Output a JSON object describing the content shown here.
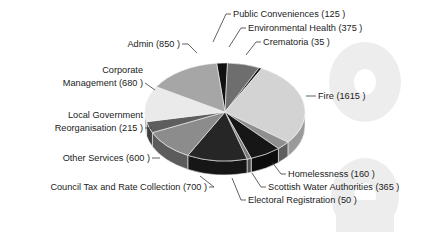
{
  "chart_data": {
    "type": "pie",
    "title": "",
    "subtitle": "",
    "xlabel": "",
    "ylabel": "",
    "legend_position": "none",
    "grid": false,
    "label_format": "{name} ({value} )",
    "total": 5895,
    "categories": [
      "Public Conveniences",
      "Environmental Health",
      "Crematoria",
      "Fire",
      "Homelessness",
      "Scottish Water Authorities",
      "Electoral Registration",
      "Council Tax and Rate Collection",
      "Other Services",
      "Local Government Reorganisation",
      "Corporate Management",
      "Admin"
    ],
    "values": [
      125,
      375,
      35,
      1615,
      160,
      365,
      50,
      700,
      600,
      215,
      680,
      850
    ],
    "slices": [
      {
        "name": "Public Conveniences",
        "value": 125,
        "label": "Public Conveniences (125 )",
        "color": "#111111",
        "side_color": "#070707"
      },
      {
        "name": "Environmental Health",
        "value": 375,
        "label": "Environmental Health (375 )",
        "color": "#6e6e6e",
        "side_color": "#4a4a4a"
      },
      {
        "name": "Crematoria",
        "value": 35,
        "label": "Crematoria (35 )",
        "color": "#1a1a1a",
        "side_color": "#101010"
      },
      {
        "name": "Fire",
        "value": 1615,
        "label": "Fire (1615 )",
        "color": "#d3d3d3",
        "side_color": "#9a9a9a"
      },
      {
        "name": "Homelessness",
        "value": 160,
        "label": "Homelessness (160 )",
        "color": "#8f8f8f",
        "side_color": "#5f5f5f"
      },
      {
        "name": "Scottish Water Authorities",
        "value": 365,
        "label": "Scottish Water Authorities (365 )",
        "color": "#161616",
        "side_color": "#0c0c0c"
      },
      {
        "name": "Electoral Registration",
        "value": 50,
        "label": "Electoral Registration (50 )",
        "color": "#7b7b7b",
        "side_color": "#525252"
      },
      {
        "name": "Council Tax and Rate Collection",
        "value": 700,
        "label": "Council Tax and Rate Collection (700 )",
        "color": "#262626",
        "side_color": "#161616"
      },
      {
        "name": "Other Services",
        "value": 600,
        "label": "Other Services (600 )",
        "color": "#8c8c8c",
        "side_color": "#5c5c5c"
      },
      {
        "name": "Local Government Reorganisation",
        "value": 215,
        "label": "Local Government Reorganisation (215 )",
        "color": "#5e5e5e",
        "side_color": "#3e3e3e"
      },
      {
        "name": "Corporate Management",
        "value": 680,
        "label": "Corporate Management (680 )",
        "color": "#eaeaea",
        "side_color": "#a8a8a8"
      },
      {
        "name": "Admin",
        "value": 850,
        "label": "Admin (850 )",
        "color": "#a6a6a6",
        "side_color": "#6e6e6e"
      }
    ]
  },
  "labels": {
    "public_conveniences": "Public Conveniences (125 )",
    "environmental_health": "Environmental Health (375 )",
    "crematoria": "Crematoria (35 )",
    "fire": "Fire (1615 )",
    "homelessness": "Homelessness (160 )",
    "scottish_water_authorities": "Scottish Water Authorities (365 )",
    "electoral_registration": "Electoral Registration (50 )",
    "council_tax": "Council Tax and Rate Collection (700 )",
    "other_services": "Other Services (600 )",
    "local_gov_line1": "Local Government",
    "local_gov_line2": "Reorganisation (215 )",
    "corporate_line1": "Corporate",
    "corporate_line2": "Management (680 )",
    "admin": "Admin (850 )"
  }
}
